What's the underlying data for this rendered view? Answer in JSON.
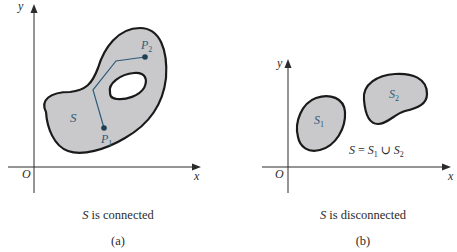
{
  "colors": {
    "region_fill": "#c9c9cb",
    "region_stroke": "#1a1a1a",
    "path_color": "#2c5a78",
    "axis_color": "#2b2b2b",
    "label_color": "#2c5a78"
  },
  "panel_a": {
    "axis_x": "x",
    "axis_y": "y",
    "origin": "O",
    "region_label": "S",
    "point1": "P",
    "point1_sub": "1",
    "point2": "P",
    "point2_sub": "2",
    "caption_var": "S",
    "caption_text": " is connected",
    "sub_label": "(a)"
  },
  "panel_b": {
    "axis_x": "x",
    "axis_y": "y",
    "origin": "O",
    "region1_label": "S",
    "region1_sub": "1",
    "region2_label": "S",
    "region2_sub": "2",
    "equation": {
      "lhs": "S",
      "eq": " = ",
      "a": "S",
      "a_sub": "1",
      "union": " ∪ ",
      "b": "S",
      "b_sub": "2"
    },
    "caption_var": "S",
    "caption_text": " is disconnected",
    "sub_label": "(b)"
  }
}
